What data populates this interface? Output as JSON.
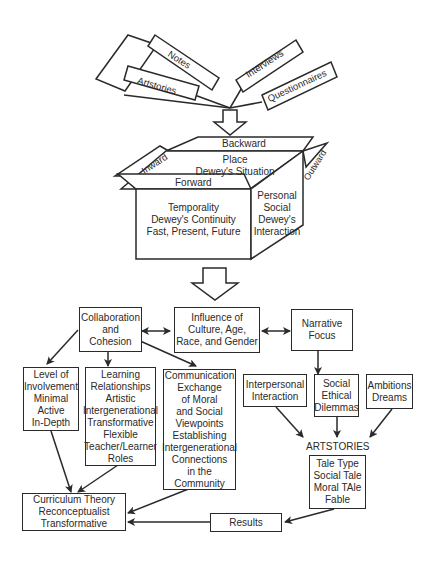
{
  "sources": [
    {
      "label": "Notes"
    },
    {
      "label": "Artstories"
    },
    {
      "label": "Interviews"
    },
    {
      "label": "Questionnaires"
    }
  ],
  "cube": {
    "top_flap": "Backward",
    "left_flap": "Inward",
    "right_flap": "Outward",
    "front_flap": "Forward",
    "top_face": [
      "Place",
      "Dewey's Situation"
    ],
    "front_face": [
      "Temporality",
      "Dewey's Continuity",
      "Fast, Present, Future"
    ],
    "side_face": [
      "Personal",
      "Social",
      "Dewey's",
      "Interaction"
    ]
  },
  "middle_row": {
    "collaboration": [
      "Collaboration",
      "and",
      "Cohesion"
    ],
    "influence": [
      "Influence of",
      "Culture, Age,",
      "Race, and Gender"
    ],
    "narrative": [
      "Narrative",
      "Focus"
    ]
  },
  "collab_children": {
    "involvement": [
      "Level of",
      "Involvement",
      "Minimal",
      "Active",
      "In-Depth"
    ],
    "learning": [
      "Learning",
      "Relationships",
      "Artistic",
      "Intergenerational",
      "Transformative",
      "Flexible",
      "Teacher/Learner",
      "Roles"
    ],
    "communication": [
      "Communication",
      "Exchange",
      "of Moral",
      "and Social",
      "Viewpoints",
      "Establishing",
      "Intergenerational",
      "Connections",
      "in the",
      "Community"
    ]
  },
  "narrative_children": {
    "interpersonal": [
      "Interpersonal",
      "Interaction"
    ],
    "social_ethical": [
      "Social",
      "Ethical",
      "Dilemmas"
    ],
    "ambitions": [
      "Ambitions",
      "Dreams"
    ]
  },
  "artstories": {
    "heading": "ARTSTORIES",
    "lines": [
      "Tale Type",
      "Social Tale",
      "Moral TAle",
      "Fable"
    ]
  },
  "results": {
    "label": "Results"
  },
  "curriculum": [
    "Curriculum Theory",
    "Reconceptualist",
    "Transformative"
  ]
}
